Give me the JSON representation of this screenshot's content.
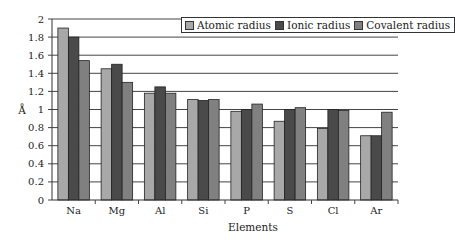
{
  "chart_data": {
    "type": "bar",
    "title": "",
    "xlabel": "Elements",
    "ylabel": "Å",
    "ylim": [
      0,
      2
    ],
    "yticks": [
      "0",
      "0.2",
      "0.4",
      "0.6",
      "0.8",
      "1",
      "1.2",
      "1.4",
      "1.6",
      "1.8",
      "2"
    ],
    "grid": true,
    "legend_position": "top-right",
    "categories": [
      "Na",
      "Mg",
      "Al",
      "Si",
      "P",
      "S",
      "Cl",
      "Ar"
    ],
    "series": [
      {
        "name": "Atomic radius",
        "color": "#a8a8a8",
        "values": [
          1.9,
          1.45,
          1.18,
          1.11,
          0.98,
          0.87,
          0.79,
          0.71
        ]
      },
      {
        "name": "Ionic radius",
        "color": "#4a4a4a",
        "values": [
          1.8,
          1.5,
          1.25,
          1.1,
          1.0,
          1.0,
          1.0,
          0.71
        ]
      },
      {
        "name": "Covalent radius",
        "color": "#808080",
        "values": [
          1.54,
          1.3,
          1.18,
          1.11,
          1.06,
          1.02,
          0.99,
          0.97
        ]
      }
    ]
  },
  "legend": {
    "items": [
      {
        "label": "Atomic radius",
        "color": "#a8a8a8"
      },
      {
        "label": "Ionic radius",
        "color": "#4a4a4a"
      },
      {
        "label": "Covalent radius",
        "color": "#808080"
      }
    ]
  }
}
